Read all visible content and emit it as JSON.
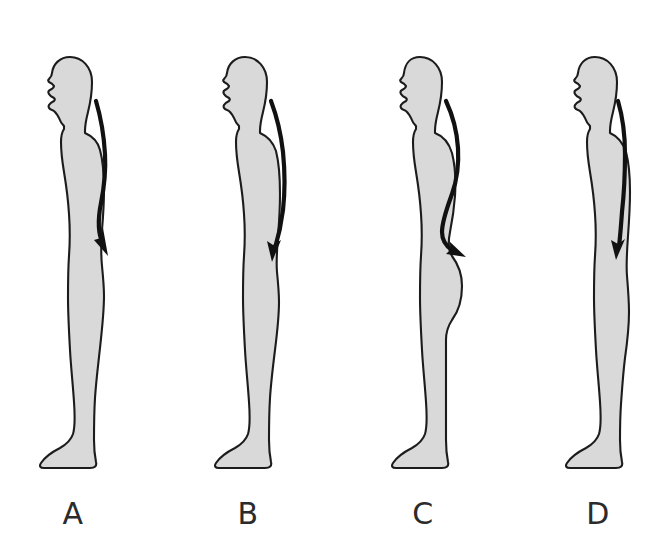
{
  "figure": {
    "background_color": "#ffffff",
    "body_fill_color": "#d9d9d9",
    "outline_color": "#1c1c1c",
    "arrow_color": "#111111",
    "orientation": "left-facing profile",
    "panel_count": 4
  },
  "panels": [
    {
      "label": "A",
      "label_x": 73,
      "label_y": 496,
      "posture_name": "kyphosis-lordosis posture",
      "arrow_description": "long curved arrow from base of neck sweeping down the spine to the sacrum",
      "arrow_start": {
        "x": 97,
        "y": 100
      },
      "arrow_end": {
        "x": 117,
        "y": 253
      },
      "head_top_y": 57,
      "foot_bottom_y": 470
    },
    {
      "label": "B",
      "label_x": 248,
      "label_y": 496,
      "posture_name": "sway-back posture",
      "arrow_description": "long curved arrow from base of neck sweeping down the spine to the sacrum",
      "arrow_start": {
        "x": 272,
        "y": 100
      },
      "arrow_end": {
        "x": 283,
        "y": 258
      },
      "head_top_y": 57,
      "foot_bottom_y": 470
    },
    {
      "label": "C",
      "label_x": 423,
      "label_y": 496,
      "posture_name": "lordotic posture",
      "arrow_description": "pronounced S-shaped arrow from base of neck to the protruding sacrum",
      "arrow_start": {
        "x": 447,
        "y": 100
      },
      "arrow_end": {
        "x": 462,
        "y": 252
      },
      "head_top_y": 57,
      "foot_bottom_y": 470
    },
    {
      "label": "D",
      "label_x": 598,
      "label_y": 496,
      "posture_name": "flat-back posture",
      "arrow_description": "nearly straight arrow from base of neck running down the spine",
      "arrow_start": {
        "x": 620,
        "y": 100
      },
      "arrow_end": {
        "x": 625,
        "y": 252
      },
      "head_top_y": 57,
      "foot_bottom_y": 470
    }
  ]
}
